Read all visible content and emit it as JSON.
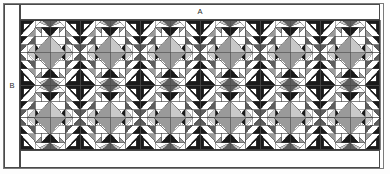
{
  "figure": {
    "type": "technical-pattern-diagram",
    "title": "",
    "background_color": "#fdfdfd",
    "labels": {
      "top": "A",
      "left": "B"
    },
    "frame": {
      "outer_stroke": "#6f6f6f",
      "inner_stroke": "#4a4a4a",
      "outer_rect": {
        "x": 3,
        "y": 3,
        "width": 381,
        "height": 166
      },
      "dimension_band_top": {
        "x": 20,
        "y": 4,
        "width": 360,
        "height": 15
      },
      "dimension_band_left": {
        "x": 4,
        "y": 4,
        "width": 15,
        "height": 164
      },
      "pattern_rect": {
        "x": 20,
        "y": 20,
        "width": 360,
        "height": 130
      }
    },
    "palette": {
      "white": "#ffffff",
      "light_gray": "#c9c9c9",
      "mid_gray": "#9a9a9a",
      "dark_gray": "#5d5d5d",
      "black": "#1a1a1a",
      "line": "#4a4a4a"
    },
    "grid": {
      "columns": 12,
      "rows": 4,
      "cell_width": 30,
      "cell_height": 32.5,
      "block_columns": 6,
      "block_rows": 2
    },
    "pattern_description": "Repeating four-fold symmetric pieced quilt block of half-square and quarter-square triangles in white, light gray, mid gray, dark gray and black, arranged in a 6 by 2 block grid with central diamonds.",
    "block_tile_fills": [
      [
        "black",
        "white",
        "light_gray",
        "mid_gray",
        "white",
        "dark_gray",
        "black",
        "white"
      ],
      [
        "white",
        "mid_gray",
        "white",
        "black",
        "light_gray",
        "white",
        "mid_gray",
        "black"
      ],
      [
        "light_gray",
        "black",
        "white",
        "dark_gray",
        "white",
        "mid_gray",
        "white",
        "light_gray"
      ],
      [
        "mid_gray",
        "white",
        "black",
        "white",
        "dark_gray",
        "white",
        "light_gray",
        "mid_gray"
      ]
    ],
    "block_fill_sequence": [
      "black",
      "white",
      "light_gray",
      "white",
      "mid_gray",
      "white",
      "dark_gray",
      "white",
      "white",
      "black",
      "white",
      "mid_gray",
      "white",
      "light_gray",
      "white",
      "dark_gray"
    ]
  }
}
